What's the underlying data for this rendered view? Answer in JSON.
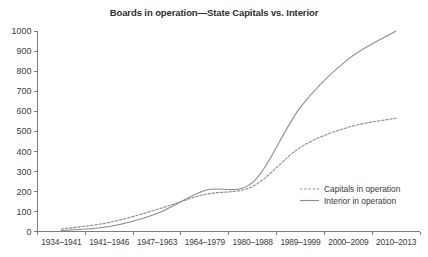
{
  "chart_data": {
    "type": "line",
    "title": "Boards in operation—State Capitals vs. Interior",
    "xlabel": "",
    "ylabel": "",
    "ylim": [
      0,
      1000
    ],
    "yticks": [
      0,
      100,
      200,
      300,
      400,
      500,
      600,
      700,
      800,
      900,
      1000
    ],
    "grid": false,
    "legend_position": "center-right",
    "categories": [
      "1934–1941",
      "1941–1946",
      "1947–1963",
      "1964–1979",
      "1980–1988",
      "1989–1999",
      "2000–2009",
      "2010–2013"
    ],
    "series": [
      {
        "name": "Capitals in operation",
        "style": "dashed",
        "color": "#8c8c8c",
        "values": [
          12,
          45,
          110,
          185,
          225,
          420,
          520,
          565
        ]
      },
      {
        "name": "Interior in operation",
        "style": "solid",
        "color": "#8c8c8c",
        "values": [
          5,
          25,
          90,
          205,
          245,
          620,
          860,
          1000
        ]
      }
    ]
  },
  "legend": {
    "items": [
      {
        "label": "Capitals in operation",
        "style": "dashed"
      },
      {
        "label": "Interior in operation",
        "style": "solid"
      }
    ]
  },
  "axis": {
    "y_tick_labels": [
      "1000",
      "900",
      "800",
      "700",
      "600",
      "500",
      "400",
      "300",
      "200",
      "100",
      "0"
    ],
    "x_tick_labels": [
      "1934–1941",
      "1941–1946",
      "1947–1963",
      "1964–1979",
      "1980–1988",
      "1989–1999",
      "2000–2009",
      "2010–2013"
    ]
  }
}
